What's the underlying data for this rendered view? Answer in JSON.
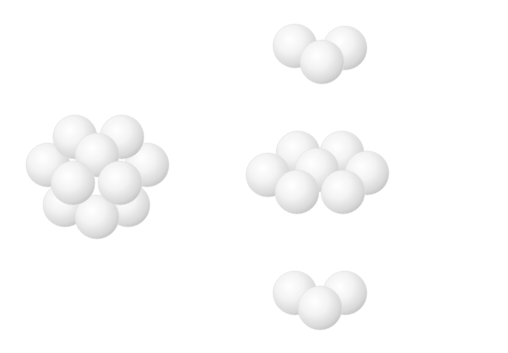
{
  "figure": {
    "sphere_radius": 22,
    "colors": {
      "highlight": "#ffffff",
      "mid": "#f1f1f1",
      "shadow": "#c9c9c9",
      "background": "#ffffff"
    },
    "clusters": [
      {
        "name": "assembled-cluster",
        "count": 10,
        "spheres": [
          {
            "x": 65,
            "y": 205
          },
          {
            "x": 128,
            "y": 205
          },
          {
            "x": 48,
            "y": 165
          },
          {
            "x": 147,
            "y": 165
          },
          {
            "x": 75,
            "y": 137
          },
          {
            "x": 122,
            "y": 137
          },
          {
            "x": 97,
            "y": 155
          },
          {
            "x": 97,
            "y": 217
          },
          {
            "x": 73,
            "y": 183
          },
          {
            "x": 120,
            "y": 183
          }
        ]
      },
      {
        "name": "top-layer",
        "count": 3,
        "spheres": [
          {
            "x": 295,
            "y": 46
          },
          {
            "x": 345,
            "y": 48
          },
          {
            "x": 322,
            "y": 62
          }
        ]
      },
      {
        "name": "middle-layer",
        "count": 7,
        "spheres": [
          {
            "x": 298,
            "y": 153
          },
          {
            "x": 342,
            "y": 153
          },
          {
            "x": 268,
            "y": 175
          },
          {
            "x": 317,
            "y": 170
          },
          {
            "x": 367,
            "y": 173
          },
          {
            "x": 297,
            "y": 192
          },
          {
            "x": 343,
            "y": 192
          }
        ]
      },
      {
        "name": "bottom-layer",
        "count": 3,
        "spheres": [
          {
            "x": 295,
            "y": 293
          },
          {
            "x": 345,
            "y": 293
          },
          {
            "x": 320,
            "y": 308
          }
        ]
      }
    ]
  }
}
